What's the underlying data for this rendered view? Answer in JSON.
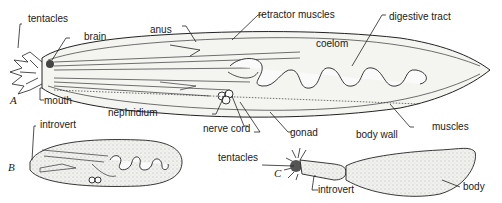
{
  "figure": {
    "panels": [
      {
        "id": "A",
        "label": "A",
        "annotations": [
          {
            "key": "tentacles",
            "text": "tentacles"
          },
          {
            "key": "brain",
            "text": "brain"
          },
          {
            "key": "anus",
            "text": "anus"
          },
          {
            "key": "retractor_muscles",
            "text": "retractor muscles"
          },
          {
            "key": "digestive_tract",
            "text": "digestive tract"
          },
          {
            "key": "coelom",
            "text": "coelom"
          },
          {
            "key": "mouth",
            "text": "mouth"
          },
          {
            "key": "nephridium",
            "text": "nephridium"
          },
          {
            "key": "nerve_cord",
            "text": "nerve cord"
          },
          {
            "key": "gonad",
            "text": "gonad"
          },
          {
            "key": "body_wall",
            "text": "body wall"
          },
          {
            "key": "muscles",
            "text": "muscles"
          }
        ]
      },
      {
        "id": "B",
        "label": "B",
        "annotations": [
          {
            "key": "introvert",
            "text": "introvert"
          }
        ]
      },
      {
        "id": "C",
        "label": "C",
        "annotations": [
          {
            "key": "tentacles",
            "text": "tentacles"
          },
          {
            "key": "introvert",
            "text": "introvert"
          },
          {
            "key": "body",
            "text": "body"
          }
        ]
      }
    ]
  },
  "colors": {
    "ink": "#222222",
    "background": "#ffffff",
    "fill": "#f4f4f1"
  }
}
